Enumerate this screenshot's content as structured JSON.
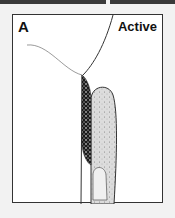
{
  "figure": {
    "panel_label": "A",
    "state_label": "Active",
    "colors": {
      "outline": "#333333",
      "tissue_fill": "#dcdcdc",
      "lesion_fill": "#1a1a1a",
      "background": "#ffffff"
    }
  }
}
